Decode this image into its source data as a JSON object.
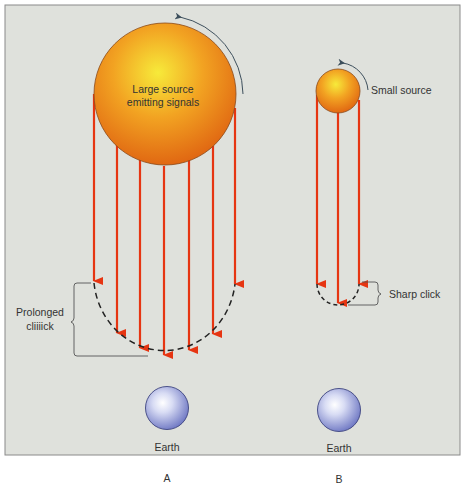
{
  "colors": {
    "panel_background": "#dfe1dc",
    "panel_border": "#8a8a8a",
    "arrow": "#e63512",
    "source_center": "#f5e634",
    "source_edge": "#e0600e",
    "earth_center": "#ffffff",
    "earth_edge": "#6f78c2",
    "text": "#333333",
    "rotation_arrow": "#3d4f5c",
    "dashed_curve": "#222222"
  },
  "panel_a": {
    "source_label_line1": "Large source",
    "source_label_line2": "emitting signals",
    "bracket_label_line1": "Prolonged",
    "bracket_label_line2": "cliiiick",
    "earth_label": "Earth",
    "panel_letter": "A",
    "signal_count": 7
  },
  "panel_b": {
    "source_label": "Small source",
    "bracket_label": "Sharp click",
    "earth_label": "Earth",
    "panel_letter": "B",
    "signal_count": 3
  }
}
